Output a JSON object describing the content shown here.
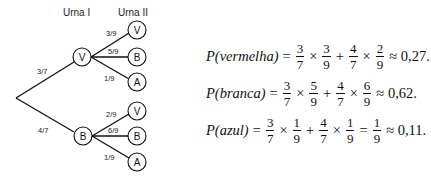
{
  "tree": {
    "headers": {
      "urna1": "Urna I",
      "urna2": "Urna II"
    },
    "level1": [
      {
        "label": "V",
        "prob": "3/7"
      },
      {
        "label": "B",
        "prob": "4/7"
      }
    ],
    "level2": [
      {
        "parent": "V",
        "label": "V",
        "prob": "3/9"
      },
      {
        "parent": "V",
        "label": "B",
        "prob": "5/9"
      },
      {
        "parent": "V",
        "label": "A",
        "prob": "1/9"
      },
      {
        "parent": "B",
        "label": "V",
        "prob": "2/9"
      },
      {
        "parent": "B",
        "label": "B",
        "prob": "6/9"
      },
      {
        "parent": "B",
        "label": "A",
        "prob": "1/9"
      }
    ]
  },
  "formulas": [
    {
      "lhs": "P(vermelha)",
      "terms": [
        [
          "3",
          "7"
        ],
        [
          "3",
          "9"
        ],
        [
          "4",
          "7"
        ],
        [
          "2",
          "9"
        ]
      ],
      "result": "≈ 0,27."
    },
    {
      "lhs": "P(branca)",
      "terms": [
        [
          "3",
          "7"
        ],
        [
          "5",
          "9"
        ],
        [
          "4",
          "7"
        ],
        [
          "6",
          "9"
        ]
      ],
      "result": "≈ 0,62."
    },
    {
      "lhs": "P(azul)",
      "terms": [
        [
          "3",
          "7"
        ],
        [
          "1",
          "9"
        ],
        [
          "4",
          "7"
        ],
        [
          "1",
          "9"
        ]
      ],
      "extra": [
        "1",
        "9"
      ],
      "result": "≈ 0,11."
    }
  ],
  "symbols": {
    "eq": "=",
    "times": "×",
    "plus": "+"
  }
}
